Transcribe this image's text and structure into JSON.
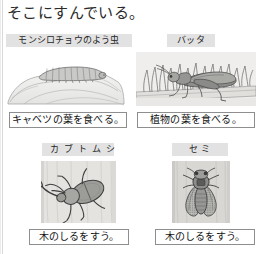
{
  "page": {
    "title": "そこにすんでいる。"
  },
  "cells": [
    {
      "id": "cell-monshirochou",
      "label": "モンシロチョウのよう虫",
      "caption": "キャベツの葉を食べる。",
      "illustration_name": "cabbage-white-larva-on-cabbage-leaf-illustration"
    },
    {
      "id": "cell-batta",
      "label": "バッタ",
      "caption": "植物の葉を食べる。",
      "illustration_name": "grasshopper-in-grass-illustration"
    },
    {
      "id": "cell-kabutomushi",
      "label": "カブトムシ",
      "caption": "木のしるをすう。",
      "illustration_name": "rhinoceros-beetle-on-tree-trunk-illustration"
    },
    {
      "id": "cell-semi",
      "label": "セ ミ",
      "caption": "木のしるをすう。",
      "illustration_name": "cicada-on-tree-trunk-illustration"
    }
  ],
  "colors": {
    "page_background": "#ffffff",
    "label_background": "#e2e2e2",
    "caption_border": "#8e8e8e",
    "text": "#1b1b1b",
    "illustration_gray": "#9a9a9a"
  }
}
